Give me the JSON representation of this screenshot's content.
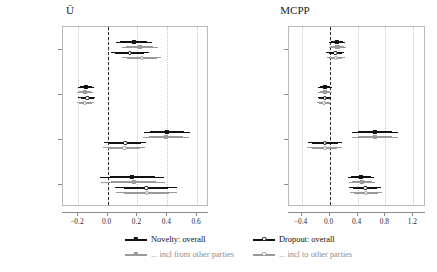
{
  "figure": {
    "width": 437,
    "height": 272,
    "background": "#ffffff"
  },
  "legend": {
    "entries": [
      {
        "label": "Novelty: overall",
        "marker": "filled-square",
        "color": "#111111",
        "name": "legend-novelty-overall"
      },
      {
        "label": "Dropout: overall",
        "marker": "open-circle",
        "color": "#111111",
        "name": "legend-dropout-overall"
      },
      {
        "label": "... incl from other parties",
        "marker": "filled-square",
        "color": "#9a9a9a",
        "name": "legend-novelty-incl-from"
      },
      {
        "label": "... incl to other parties",
        "marker": "open-circle",
        "color": "#9a9a9a",
        "name": "legend-dropout-incl-to"
      }
    ]
  },
  "colors": {
    "dark": "#111111",
    "light": "#9a9a9a",
    "grid": "#c9c9c9",
    "frame": "#b9b9b9",
    "zero": "#2b2b2b"
  },
  "chart_data": [
    {
      "type": "forest",
      "title": "Ü",
      "panel": "left",
      "xlabel": "",
      "ylabel": "",
      "xlim": [
        -0.3,
        0.68
      ],
      "xticks": [
        -0.2,
        0.0,
        0.2,
        0.4,
        0.6
      ],
      "xticklabels": [
        "−0.2",
        "0.0",
        "0.2",
        "0.4",
        "0.6"
      ],
      "grid": true,
      "zero_line": 0.0,
      "categories": [
        "log10Ü",
        "log10ν",
        "log10votechange",
        "Constant"
      ],
      "categorylabels": [
        "log₁₀Ü",
        "log₁₀ν",
        "log₁₀votechange",
        "Constant"
      ],
      "series": [
        {
          "name": "Novelty: overall",
          "marker": "filled-square",
          "color": "#111111",
          "points": [
            {
              "category": "log10Ü",
              "estimate": 0.175,
              "ci_inner": [
                0.085,
                0.265
              ],
              "ci_outer": [
                0.055,
                0.295
              ]
            },
            {
              "category": "log10ν",
              "estimate": -0.145,
              "ci_inner": [
                -0.185,
                -0.105
              ],
              "ci_outer": [
                -0.198,
                -0.092
              ]
            },
            {
              "category": "log10votechange",
              "estimate": 0.398,
              "ci_inner": [
                0.285,
                0.512
              ],
              "ci_outer": [
                0.245,
                0.552
              ]
            },
            {
              "category": "Constant",
              "estimate": 0.165,
              "ci_inner": [
                0.015,
                0.315
              ],
              "ci_outer": [
                -0.055,
                0.375
              ]
            }
          ]
        },
        {
          "name": "... incl from other parties",
          "marker": "filled-square",
          "color": "#9a9a9a",
          "points": [
            {
              "category": "log10Ü",
              "estimate": 0.215,
              "ci_inner": [
                0.125,
                0.305
              ],
              "ci_outer": [
                0.095,
                0.335
              ]
            },
            {
              "category": "log10ν",
              "estimate": -0.152,
              "ci_inner": [
                -0.192,
                -0.112
              ],
              "ci_outer": [
                -0.205,
                -0.1
              ]
            },
            {
              "category": "log10votechange",
              "estimate": 0.392,
              "ci_inner": [
                0.278,
                0.505
              ],
              "ci_outer": [
                0.238,
                0.545
              ]
            },
            {
              "category": "Constant",
              "estimate": 0.175,
              "ci_inner": [
                0.025,
                0.325
              ],
              "ci_outer": [
                -0.045,
                0.385
              ]
            }
          ]
        },
        {
          "name": "Dropout: overall",
          "marker": "open-circle",
          "color": "#111111",
          "points": [
            {
              "category": "log10Ü",
              "estimate": 0.148,
              "ci_inner": [
                0.052,
                0.245
              ],
              "ci_outer": [
                0.022,
                0.275
              ]
            },
            {
              "category": "log10ν",
              "estimate": -0.138,
              "ci_inner": [
                -0.182,
                -0.095
              ],
              "ci_outer": [
                -0.198,
                -0.082
              ]
            },
            {
              "category": "log10votechange",
              "estimate": 0.118,
              "ci_inner": [
                0.012,
                0.222
              ],
              "ci_outer": [
                -0.025,
                0.258
              ]
            },
            {
              "category": "Constant",
              "estimate": 0.258,
              "ci_inner": [
                0.108,
                0.408
              ],
              "ci_outer": [
                0.052,
                0.462
              ]
            }
          ]
        },
        {
          "name": "... incl to other parties",
          "marker": "open-circle",
          "color": "#9a9a9a",
          "points": [
            {
              "category": "log10Ü",
              "estimate": 0.228,
              "ci_inner": [
                0.128,
                0.328
              ],
              "ci_outer": [
                0.098,
                0.358
              ]
            },
            {
              "category": "log10ν",
              "estimate": -0.152,
              "ci_inner": [
                -0.195,
                -0.108
              ],
              "ci_outer": [
                -0.208,
                -0.095
              ]
            },
            {
              "category": "log10votechange",
              "estimate": 0.112,
              "ci_inner": [
                0.005,
                0.218
              ],
              "ci_outer": [
                -0.032,
                0.252
              ]
            },
            {
              "category": "Constant",
              "estimate": 0.262,
              "ci_inner": [
                0.112,
                0.412
              ],
              "ci_outer": [
                0.058,
                0.468
              ]
            }
          ]
        }
      ]
    },
    {
      "type": "forest",
      "title": "MCPP",
      "panel": "right",
      "xlabel": "",
      "ylabel": "",
      "xlim": [
        -0.58,
        1.38
      ],
      "xticks": [
        -0.4,
        0.0,
        0.4,
        0.8,
        1.2
      ],
      "xticklabels": [
        "−0.4",
        "0.0",
        "0.4",
        "0.8",
        "1.2"
      ],
      "grid": true,
      "zero_line": 0.0,
      "categories": [
        "log10MCPP",
        "log10ν",
        "log10votechange",
        "Constant"
      ],
      "categorylabels": [
        "log₁₀MCPP",
        "log₁₀ν",
        "log₁₀votechange",
        "Constant"
      ],
      "series": [
        {
          "name": "Novelty: overall",
          "marker": "filled-square",
          "color": "#111111",
          "points": [
            {
              "category": "log10MCPP",
              "estimate": 0.105,
              "ci_inner": [
                0.018,
                0.192
              ],
              "ci_outer": [
                -0.012,
                0.222
              ]
            },
            {
              "category": "log10ν",
              "estimate": -0.062,
              "ci_inner": [
                -0.135,
                0.012
              ],
              "ci_outer": [
                -0.158,
                0.035
              ]
            },
            {
              "category": "log10votechange",
              "estimate": 0.652,
              "ci_inner": [
                0.412,
                0.892
              ],
              "ci_outer": [
                0.322,
                0.982
              ]
            },
            {
              "category": "Constant",
              "estimate": 0.452,
              "ci_inner": [
                0.312,
                0.592
              ],
              "ci_outer": [
                0.262,
                0.642
              ]
            }
          ]
        },
        {
          "name": "... incl from other parties",
          "marker": "filled-square",
          "color": "#9a9a9a",
          "points": [
            {
              "category": "log10MCPP",
              "estimate": 0.112,
              "ci_inner": [
                0.022,
                0.202
              ],
              "ci_outer": [
                -0.008,
                0.232
              ]
            },
            {
              "category": "log10ν",
              "estimate": -0.068,
              "ci_inner": [
                -0.142,
                0.008
              ],
              "ci_outer": [
                -0.165,
                0.03
              ]
            },
            {
              "category": "log10votechange",
              "estimate": 0.648,
              "ci_inner": [
                0.408,
                0.888
              ],
              "ci_outer": [
                0.318,
                0.978
              ]
            },
            {
              "category": "Constant",
              "estimate": 0.462,
              "ci_inner": [
                0.322,
                0.602
              ],
              "ci_outer": [
                0.272,
                0.652
              ]
            }
          ]
        },
        {
          "name": "Dropout: overall",
          "marker": "open-circle",
          "color": "#111111",
          "points": [
            {
              "category": "log10MCPP",
              "estimate": 0.082,
              "ci_inner": [
                -0.012,
                0.175
              ],
              "ci_outer": [
                -0.045,
                0.208
              ]
            },
            {
              "category": "log10ν",
              "estimate": -0.072,
              "ci_inner": [
                -0.148,
                0.005
              ],
              "ci_outer": [
                -0.172,
                0.028
              ]
            },
            {
              "category": "log10votechange",
              "estimate": -0.065,
              "ci_inner": [
                -0.245,
                0.118
              ],
              "ci_outer": [
                -0.312,
                0.182
              ]
            },
            {
              "category": "Constant",
              "estimate": 0.512,
              "ci_inner": [
                0.342,
                0.682
              ],
              "ci_outer": [
                0.282,
                0.742
              ]
            }
          ]
        },
        {
          "name": "... incl to other parties",
          "marker": "open-circle",
          "color": "#9a9a9a",
          "points": [
            {
              "category": "log10MCPP",
              "estimate": 0.088,
              "ci_inner": [
                -0.008,
                0.182
              ],
              "ci_outer": [
                -0.04,
                0.215
              ]
            },
            {
              "category": "log10ν",
              "estimate": -0.078,
              "ci_inner": [
                -0.155,
                0.0
              ],
              "ci_outer": [
                -0.178,
                0.022
              ]
            },
            {
              "category": "log10votechange",
              "estimate": -0.072,
              "ci_inner": [
                -0.252,
                0.112
              ],
              "ci_outer": [
                -0.318,
                0.175
              ]
            },
            {
              "category": "Constant",
              "estimate": 0.518,
              "ci_inner": [
                0.348,
                0.688
              ],
              "ci_outer": [
                0.288,
                0.748
              ]
            }
          ]
        }
      ]
    }
  ]
}
